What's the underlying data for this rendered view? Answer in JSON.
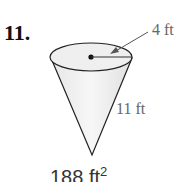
{
  "problem": {
    "number": "11.",
    "shape": "cone",
    "radius_label": "4 ft",
    "slant_height_label": "11 ft",
    "answer_value": "188 ft",
    "answer_exponent": "2"
  }
}
